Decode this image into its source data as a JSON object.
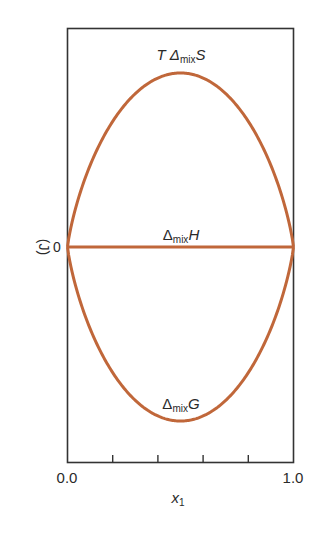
{
  "chart_data": {
    "type": "line",
    "title": "",
    "xlabel": "x1",
    "ylabel": "(J)",
    "xlim": [
      0.0,
      1.0
    ],
    "ylim": [
      -0.85,
      0.85
    ],
    "x_tick_labels": [
      "0.0",
      "1.0"
    ],
    "x_minor_ticks": [
      0.2,
      0.4,
      0.6,
      0.8
    ],
    "y_tick_labels": [
      "0"
    ],
    "grid": false,
    "legend": "inline labels",
    "x": [
      0.0,
      0.05,
      0.1,
      0.15,
      0.2,
      0.25,
      0.3,
      0.35,
      0.4,
      0.45,
      0.5,
      0.55,
      0.6,
      0.65,
      0.7,
      0.75,
      0.8,
      0.85,
      0.9,
      0.95,
      1.0
    ],
    "series": [
      {
        "name": "TΔmixS",
        "label_main": "T Δ",
        "label_sub": "mix",
        "label_end": "S",
        "values": [
          0.0,
          0.199,
          0.325,
          0.423,
          0.5,
          0.562,
          0.611,
          0.647,
          0.673,
          0.688,
          0.693,
          0.688,
          0.673,
          0.647,
          0.611,
          0.562,
          0.5,
          0.423,
          0.325,
          0.199,
          0.0
        ]
      },
      {
        "name": "ΔmixH",
        "label_main": "Δ",
        "label_sub": "mix",
        "label_end": "H",
        "values": [
          0.0,
          0.0,
          0.0,
          0.0,
          0.0,
          0.0,
          0.0,
          0.0,
          0.0,
          0.0,
          0.0,
          0.0,
          0.0,
          0.0,
          0.0,
          0.0,
          0.0,
          0.0,
          0.0,
          0.0,
          0.0
        ]
      },
      {
        "name": "ΔmixG",
        "label_main": "Δ",
        "label_sub": "mix",
        "label_end": "G",
        "values": [
          0.0,
          -0.199,
          -0.325,
          -0.423,
          -0.5,
          -0.562,
          -0.611,
          -0.647,
          -0.673,
          -0.688,
          -0.693,
          -0.688,
          -0.673,
          -0.647,
          -0.611,
          -0.562,
          -0.5,
          -0.423,
          -0.325,
          -0.199,
          0.0
        ]
      }
    ],
    "colors": {
      "curve": "#c0673a",
      "axis": "#333333",
      "text": "#2a2a2a"
    }
  },
  "axis": {
    "x_label_main": "x",
    "x_label_sub": "1",
    "y_unit": "(J)",
    "y_zero": "0",
    "x_min_label": "0.0",
    "x_max_label": "1.0"
  }
}
